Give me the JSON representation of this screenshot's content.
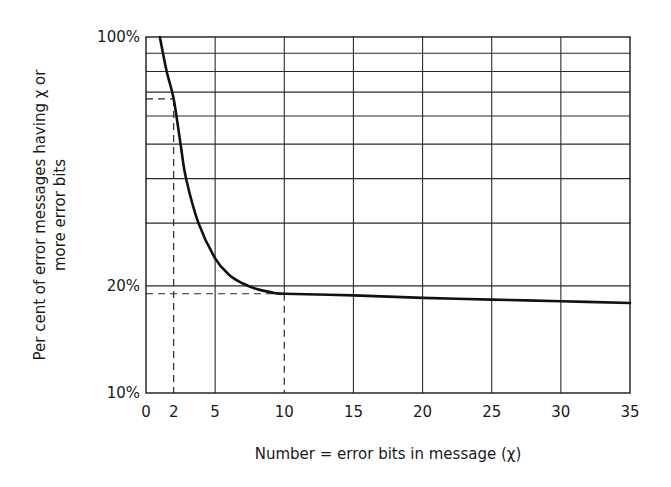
{
  "chart_data": {
    "type": "line",
    "title": "",
    "xlabel": "Number = error bits in message (χ)",
    "ylabel_line1": "Per cent of error messages having  χ  or",
    "ylabel_line2": "more error bits",
    "x_scale": "linear",
    "y_scale": "log",
    "xlim": [
      0,
      35
    ],
    "ylim": [
      10,
      100
    ],
    "x_ticks": [
      0,
      2,
      5,
      10,
      15,
      20,
      25,
      30,
      35
    ],
    "x_tick_labels": [
      "0",
      "2",
      "5",
      "10",
      "15",
      "20",
      "25",
      "30",
      "35"
    ],
    "x_gridlines": [
      5,
      10,
      15,
      20,
      25,
      30
    ],
    "y_tick_labels": [
      {
        "value": 100,
        "label": "100%"
      },
      {
        "value": 20,
        "label": "20%"
      },
      {
        "value": 10,
        "label": "10%"
      }
    ],
    "y_gridlines": [
      20,
      30,
      40,
      50,
      60,
      70,
      80,
      90
    ],
    "grid": true,
    "legend": null,
    "series": [
      {
        "name": "error messages with χ or more error bits",
        "x": [
          1.0,
          1.5,
          2,
          2.5,
          2.9,
          3.8,
          5,
          6,
          7,
          8,
          9,
          10,
          15,
          20,
          25,
          30,
          35
        ],
        "y": [
          100,
          80,
          67,
          50,
          40,
          30,
          23.9,
          21.5,
          20.3,
          19.6,
          19.2,
          19.0,
          18.8,
          18.5,
          18.3,
          18.1,
          17.9
        ]
      }
    ],
    "annotations": [
      {
        "type": "dashed-reference",
        "x": 2,
        "y": 67,
        "note": "dashed lines from x=2 up to curve and across to y-axis (~67%)"
      },
      {
        "type": "dashed-reference",
        "x": 10,
        "y": 19,
        "note": "dashed lines from x=10 up to curve and across to y-axis (~19%)"
      }
    ]
  }
}
